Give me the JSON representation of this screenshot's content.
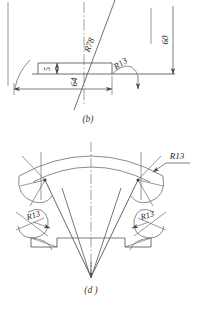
{
  "drawing": {
    "title": "Engineering drawing sheet with two views",
    "line_color": "#4a4a4a",
    "text_color": "#2a2a2a",
    "background": "#ffffff"
  },
  "figure_b": {
    "caption": "(b)",
    "dimensions": [
      {
        "id": "dim-60",
        "label": "60",
        "orientation": "vertical",
        "kind": "linear"
      },
      {
        "id": "dim-64",
        "label": "64",
        "orientation": "vertical",
        "kind": "linear"
      },
      {
        "id": "dim-5",
        "label": "5",
        "orientation": "vertical",
        "kind": "linear"
      },
      {
        "id": "rad-r78",
        "label": "R78",
        "orientation": "inclined",
        "kind": "radius"
      },
      {
        "id": "rad-r13",
        "label": "R13",
        "orientation": "inclined",
        "kind": "radius"
      }
    ]
  },
  "figure_d": {
    "caption": "(d )",
    "dimensions": [
      {
        "id": "d-rad-r13-top",
        "label": "R13",
        "orientation": "horizontal",
        "kind": "radius"
      },
      {
        "id": "d-rad-r13-left",
        "label": "R13",
        "orientation": "inclined",
        "kind": "radius"
      },
      {
        "id": "d-rad-r13-right",
        "label": "R13",
        "orientation": "inclined",
        "kind": "radius"
      }
    ]
  }
}
